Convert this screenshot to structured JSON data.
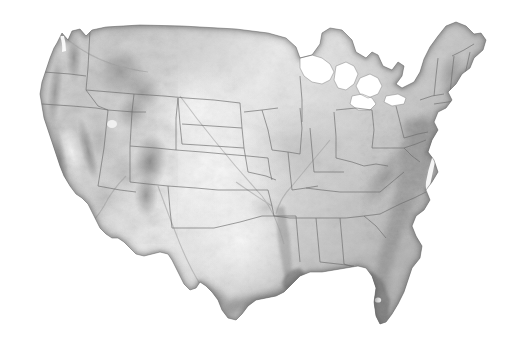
{
  "figure": {
    "kind": "shaded-relief-map",
    "region": "Contiguous United States",
    "background_color": "#ffffff",
    "has_title": false,
    "has_legend": false,
    "has_labels": false,
    "has_scalebar": false,
    "color_mode": "grayscale",
    "width_px": 513,
    "height_px": 346,
    "map_bbox_px": {
      "x": 38,
      "y": 24,
      "width": 452,
      "height": 302
    },
    "boundaries": {
      "type": "state-borders",
      "color": "#6b6b6b",
      "stroke_px": 0.7
    },
    "coastline": {
      "color": "#5e5e5e",
      "stroke_px": 0.6
    },
    "relief": {
      "light_azimuth_deg": 315,
      "lowland_tone": "#efefef",
      "midland_tone": "#c9c9c9",
      "highland_tone": "#8a8a8a",
      "shadow_tone": "#6a6a6a",
      "coastal_dark_tone": "#7d7d7d"
    },
    "terrain_features": [
      {
        "name": "Cascade Range",
        "tone": "dark"
      },
      {
        "name": "Coast Ranges",
        "tone": "dark"
      },
      {
        "name": "Sierra Nevada",
        "tone": "dark"
      },
      {
        "name": "Central Valley",
        "tone": "light"
      },
      {
        "name": "Great Basin",
        "tone": "mid"
      },
      {
        "name": "Rocky Mountains",
        "tone": "dark"
      },
      {
        "name": "Colorado Plateau",
        "tone": "mid-dark"
      },
      {
        "name": "Great Plains",
        "tone": "light"
      },
      {
        "name": "Ozark Plateau",
        "tone": "mid"
      },
      {
        "name": "Appalachian Mountains",
        "tone": "mid-dark"
      },
      {
        "name": "Mississippi River Valley",
        "tone": "dark-linear"
      },
      {
        "name": "Atlantic Coastal Plain",
        "tone": "dark"
      },
      {
        "name": "Gulf Coastal Plain",
        "tone": "dark"
      },
      {
        "name": "Florida Peninsula",
        "tone": "dark"
      }
    ],
    "water_features": [
      {
        "name": "Lake Superior",
        "rendered": "cut-out-white"
      },
      {
        "name": "Lake Michigan",
        "rendered": "cut-out-white"
      },
      {
        "name": "Lake Huron",
        "rendered": "cut-out-white"
      },
      {
        "name": "Lake Erie",
        "rendered": "cut-out-white"
      },
      {
        "name": "Lake Ontario",
        "rendered": "cut-out-white"
      },
      {
        "name": "Great Salt Lake",
        "rendered": "light-patch"
      },
      {
        "name": "Lake Okeechobee",
        "rendered": "light-patch"
      },
      {
        "name": "Chesapeake Bay",
        "rendered": "cut-out-white"
      },
      {
        "name": "Puget Sound",
        "rendered": "cut-out-white"
      }
    ],
    "states_visible": [
      "Washington",
      "Oregon",
      "California",
      "Idaho",
      "Nevada",
      "Montana",
      "Wyoming",
      "Utah",
      "Arizona",
      "Colorado",
      "New Mexico",
      "North Dakota",
      "South Dakota",
      "Nebraska",
      "Kansas",
      "Oklahoma",
      "Texas",
      "Minnesota",
      "Iowa",
      "Missouri",
      "Arkansas",
      "Louisiana",
      "Wisconsin",
      "Illinois",
      "Michigan",
      "Indiana",
      "Ohio",
      "Kentucky",
      "Tennessee",
      "Mississippi",
      "Alabama",
      "Georgia",
      "Florida",
      "South Carolina",
      "North Carolina",
      "Virginia",
      "West Virginia",
      "Maryland",
      "Delaware",
      "Pennsylvania",
      "New Jersey",
      "New York",
      "Connecticut",
      "Rhode Island",
      "Massachusetts",
      "Vermont",
      "New Hampshire",
      "Maine"
    ]
  }
}
